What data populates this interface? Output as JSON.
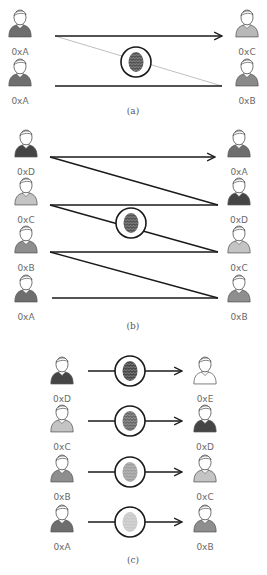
{
  "colors": {
    "line": "#1a1a1a",
    "faint_line": "#b8b8b8",
    "shirt_dark": "#4a4a4a",
    "shirt_mid": "#7a7a7a",
    "shirt_light": "#c4c4c4",
    "shirt_white": "#ffffff",
    "label": "#6a6a6a"
  },
  "panels": [
    {
      "id": "a",
      "caption": "(a)",
      "left_users": [
        {
          "label": "0xA",
          "shirt": "#6e6e6e"
        },
        {
          "label": "0xA",
          "shirt": "#6e6e6e"
        }
      ],
      "right_users": [
        {
          "label": "0xC",
          "shirt": "#b8b8b8"
        },
        {
          "label": "0xB",
          "shirt": "#8a8a8a"
        }
      ],
      "fingerprint_tone": "#555555"
    },
    {
      "id": "b",
      "caption": "(b)",
      "left_users": [
        {
          "label": "0xD",
          "shirt": "#454545"
        },
        {
          "label": "0xC",
          "shirt": "#c4c4c4"
        },
        {
          "label": "0xB",
          "shirt": "#8e8e8e"
        },
        {
          "label": "0xA",
          "shirt": "#6e6e6e"
        }
      ],
      "right_users": [
        {
          "label": "0xA",
          "shirt": "#6e6e6e"
        },
        {
          "label": "0xD",
          "shirt": "#454545"
        },
        {
          "label": "0xC",
          "shirt": "#c4c4c4"
        },
        {
          "label": "0xB",
          "shirt": "#8e8e8e"
        }
      ],
      "fingerprint_tone": "#555555"
    },
    {
      "id": "c",
      "caption": "(c)",
      "rows": [
        {
          "from": "0xD",
          "from_shirt": "#454545",
          "to": "0xE",
          "to_shirt": "#ffffff",
          "fingerprint_tone": "#4a4a4a"
        },
        {
          "from": "0xC",
          "from_shirt": "#c4c4c4",
          "to": "0xD",
          "to_shirt": "#454545",
          "fingerprint_tone": "#6a6a6a"
        },
        {
          "from": "0xB",
          "from_shirt": "#8e8e8e",
          "to": "0xC",
          "to_shirt": "#c4c4c4",
          "fingerprint_tone": "#a0a0a0"
        },
        {
          "from": "0xA",
          "from_shirt": "#6e6e6e",
          "to": "0xB",
          "to_shirt": "#8e8e8e",
          "fingerprint_tone": "#c8c8c8"
        }
      ]
    }
  ]
}
